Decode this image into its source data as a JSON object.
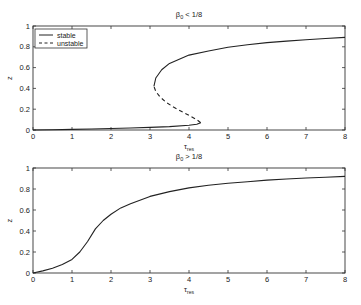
{
  "chart_data": [
    {
      "type": "line",
      "title": "β0 < 1/8",
      "title_parts": {
        "symbol": "β",
        "subscript": "0",
        "rest": " < 1/8"
      },
      "xlabel": "τres",
      "xlabel_parts": {
        "symbol": "τ",
        "subscript": "res"
      },
      "ylabel": "z",
      "xlim": [
        0,
        8
      ],
      "ylim": [
        0,
        1
      ],
      "xticks": [
        "0",
        "1",
        "2",
        "3",
        "4",
        "5",
        "6",
        "7",
        "8"
      ],
      "yticks": [
        "0",
        "0.2",
        "0.4",
        "0.6",
        "0.8",
        "1"
      ],
      "grid": false,
      "legend": {
        "position": "upper left",
        "entries": [
          {
            "label": "stable",
            "style": "solid"
          },
          {
            "label": "unstable",
            "style": "dashed"
          }
        ]
      },
      "series": [
        {
          "name": "stable (lower branch)",
          "style": "solid",
          "x": [
            0,
            0.5,
            1,
            1.5,
            2,
            2.5,
            3,
            3.5,
            4,
            4.2,
            4.3
          ],
          "y": [
            0,
            0.003,
            0.006,
            0.01,
            0.014,
            0.019,
            0.025,
            0.033,
            0.045,
            0.055,
            0.07
          ]
        },
        {
          "name": "unstable (middle branch)",
          "style": "dashed",
          "x": [
            4.3,
            4.2,
            4.0,
            3.8,
            3.6,
            3.4,
            3.25,
            3.15,
            3.1
          ],
          "y": [
            0.07,
            0.1,
            0.14,
            0.18,
            0.22,
            0.27,
            0.32,
            0.37,
            0.42
          ]
        },
        {
          "name": "stable (upper branch)",
          "style": "solid",
          "x": [
            3.1,
            3.15,
            3.3,
            3.5,
            4,
            4.5,
            5,
            5.5,
            6,
            6.5,
            7,
            7.5,
            8
          ],
          "y": [
            0.42,
            0.5,
            0.58,
            0.64,
            0.72,
            0.76,
            0.795,
            0.82,
            0.84,
            0.855,
            0.868,
            0.88,
            0.89
          ]
        }
      ]
    },
    {
      "type": "line",
      "title": "β0 > 1/8",
      "title_parts": {
        "symbol": "β",
        "subscript": "0",
        "rest": " > 1/8"
      },
      "xlabel": "τres",
      "xlabel_parts": {
        "symbol": "τ",
        "subscript": "res"
      },
      "ylabel": "z",
      "xlim": [
        0,
        8
      ],
      "ylim": [
        0,
        1
      ],
      "xticks": [
        "0",
        "1",
        "2",
        "3",
        "4",
        "5",
        "6",
        "7",
        "8"
      ],
      "yticks": [
        "0",
        "0.2",
        "0.4",
        "0.6",
        "0.8",
        "1"
      ],
      "grid": false,
      "series": [
        {
          "name": "stable",
          "style": "solid",
          "x": [
            0,
            0.25,
            0.5,
            0.75,
            1,
            1.2,
            1.4,
            1.6,
            1.8,
            2,
            2.25,
            2.5,
            3,
            3.5,
            4,
            4.5,
            5,
            5.5,
            6,
            6.5,
            7,
            7.5,
            8
          ],
          "y": [
            0,
            0.02,
            0.045,
            0.08,
            0.13,
            0.2,
            0.3,
            0.42,
            0.5,
            0.56,
            0.62,
            0.66,
            0.73,
            0.775,
            0.81,
            0.835,
            0.855,
            0.87,
            0.885,
            0.895,
            0.905,
            0.912,
            0.92
          ]
        }
      ]
    }
  ]
}
